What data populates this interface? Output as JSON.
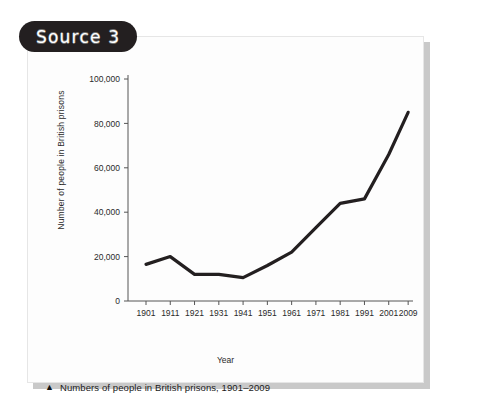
{
  "source_badge": {
    "label": "Source 3"
  },
  "caption": {
    "marker_icon": "triangle-icon",
    "text": "Numbers of people in British prisons, 1901–2009"
  },
  "colors": {
    "badge_background": "#231f20",
    "badge_text": "#ffffff",
    "line": "#231f20",
    "axis": "#555555",
    "card_background": "#fdfdfd",
    "card_shadow": "#c9c9c9",
    "page_background": "#ffffff"
  },
  "chart_data": {
    "type": "line",
    "title": "",
    "xlabel": "Year",
    "ylabel": "Number of people in British prisons",
    "x": [
      1901,
      1911,
      1921,
      1931,
      1941,
      1951,
      1961,
      1971,
      1981,
      1991,
      2001,
      2009
    ],
    "xtick_labels": [
      "1901",
      "1911",
      "1921",
      "1931",
      "1941",
      "1951",
      "1961",
      "1971",
      "1981",
      "1991",
      "2001",
      "2009"
    ],
    "values": [
      16500,
      20000,
      12000,
      12000,
      10500,
      16000,
      22000,
      33000,
      44000,
      46000,
      66000,
      85000
    ],
    "ylim": [
      0,
      100000
    ],
    "ytick_values": [
      0,
      20000,
      40000,
      60000,
      80000,
      100000
    ],
    "ytick_labels": [
      "0",
      "20,000",
      "40,000",
      "60,000",
      "80,000",
      "100,000"
    ],
    "grid": false,
    "legend": false,
    "series": [
      {
        "name": "Number of people in British prisons",
        "values": [
          16500,
          20000,
          12000,
          12000,
          10500,
          16000,
          22000,
          33000,
          44000,
          46000,
          66000,
          85000
        ]
      }
    ]
  }
}
